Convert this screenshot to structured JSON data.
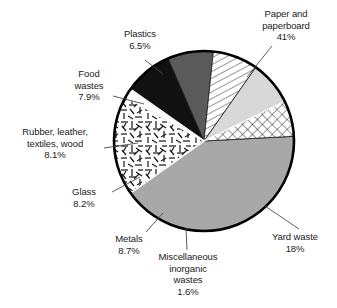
{
  "figure": {
    "kind": "pie-chart",
    "background_color": "#ffffff",
    "outline_color": "#000000",
    "label_text_color": "#1b1b1b"
  },
  "chart_data": {
    "type": "pie",
    "title": "",
    "subtitle": "",
    "xlabel": "",
    "ylabel": "",
    "grid": false,
    "legend_position": "none",
    "label_style": "external labels with leader lines",
    "units": "percent of total",
    "start_angle_deg": -3,
    "direction": "clockwise",
    "center": {
      "x": 204,
      "y": 141
    },
    "radius": 90,
    "categories": [
      "Paper and paperboard",
      "Yard waste",
      "Miscellaneous inorganic wastes",
      "Metals",
      "Glass",
      "Rubber, leather, textiles, wood",
      "Food wastes",
      "Plastics"
    ],
    "values": [
      41,
      18,
      1.6,
      8.7,
      8.2,
      8.1,
      7.9,
      6.5
    ],
    "value_labels": [
      "41%",
      "18%",
      "1.6%",
      "8.7%",
      "8.2%",
      "8.1%",
      "7.9%",
      "6.5%"
    ],
    "slices": [
      {
        "name": "Paper and paperboard",
        "value": 41,
        "value_label": "41%",
        "fill": "#a8a8a8",
        "pattern": "solid-medium-gray",
        "label_lines": [
          "Paper and",
          "paperboard",
          "41%"
        ],
        "label_position": "top-right"
      },
      {
        "name": "Yard waste",
        "value": 18,
        "value_label": "18%",
        "fill": "#ffffff",
        "pattern": "random-short-dash-texture",
        "label_lines": [
          "Yard waste",
          "18%"
        ],
        "label_position": "bottom-right"
      },
      {
        "name": "Miscellaneous inorganic wastes",
        "value": 1.6,
        "value_label": "1.6%",
        "fill": "#ffffff",
        "pattern": "solid-white",
        "label_lines": [
          "Miscellaneous",
          "inorganic",
          "wastes",
          "1.6%"
        ],
        "label_position": "bottom-center"
      },
      {
        "name": "Metals",
        "value": 8.7,
        "value_label": "8.7%",
        "fill": "#111111",
        "pattern": "solid-black",
        "label_lines": [
          "Metals",
          "8.7%"
        ],
        "label_position": "bottom-left"
      },
      {
        "name": "Glass",
        "value": 8.2,
        "value_label": "8.2%",
        "fill": "#5a5a5a",
        "pattern": "solid-dark-gray",
        "label_lines": [
          "Glass",
          "8.2%"
        ],
        "label_position": "left-lower"
      },
      {
        "name": "Rubber, leather, textiles, wood",
        "value": 8.1,
        "value_label": "8.1%",
        "fill": "#ffffff",
        "pattern": "diagonal-hatch",
        "label_lines": [
          "Rubber, leather,",
          "textiles, wood",
          "8.1%"
        ],
        "label_position": "left-middle"
      },
      {
        "name": "Food wastes",
        "value": 7.9,
        "value_label": "7.9%",
        "fill": "#d8d8d8",
        "pattern": "solid-light-gray",
        "label_lines": [
          "Food",
          "wastes",
          "7.9%"
        ],
        "label_position": "left-upper"
      },
      {
        "name": "Plastics",
        "value": 6.5,
        "value_label": "6.5%",
        "fill": "#ffffff",
        "pattern": "cross-hatch",
        "label_lines": [
          "Plastics",
          "6.5%"
        ],
        "label_position": "top-left"
      }
    ]
  },
  "labels": {
    "paper": "Paper and\npaperboard\n41%",
    "plastics": "Plastics\n6.5%",
    "food": "Food\nwastes\n7.9%",
    "rubber": "Rubber, leather,\ntextiles, wood\n8.1%",
    "glass": "Glass\n8.2%",
    "metals": "Metals\n8.7%",
    "misc": "Miscellaneous\ninorganic\nwastes\n1.6%",
    "yard": "Yard waste\n18%"
  }
}
